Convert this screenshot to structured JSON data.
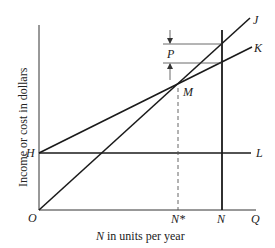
{
  "diagram": {
    "type": "break-even chart",
    "y_axis_label": "Income or cost in dollars",
    "x_axis_label": {
      "variable": "N",
      "text": " in units per year"
    },
    "point_labels": {
      "origin": "O",
      "H": "H",
      "L": "L",
      "J": "J",
      "K": "K",
      "M": "M",
      "P": "P",
      "N_star": "N*",
      "N": "N",
      "Q": "Q"
    },
    "lines": [
      {
        "name": "OJ",
        "from": "O",
        "to": "J",
        "style": "solid"
      },
      {
        "name": "HK",
        "from": "H",
        "to": "K",
        "style": "solid"
      },
      {
        "name": "HL",
        "from": "H",
        "to": "L",
        "style": "solid",
        "orientation": "horizontal"
      },
      {
        "name": "N-vertical",
        "at": "N",
        "style": "solid",
        "orientation": "vertical"
      },
      {
        "name": "N*-dashed",
        "from": "M",
        "to": "N*",
        "style": "dashed"
      }
    ],
    "annotations": {
      "intersection": "M",
      "gap_label": "P"
    },
    "colors": {
      "line": "#1a1a1a",
      "background": "#ffffff"
    }
  }
}
